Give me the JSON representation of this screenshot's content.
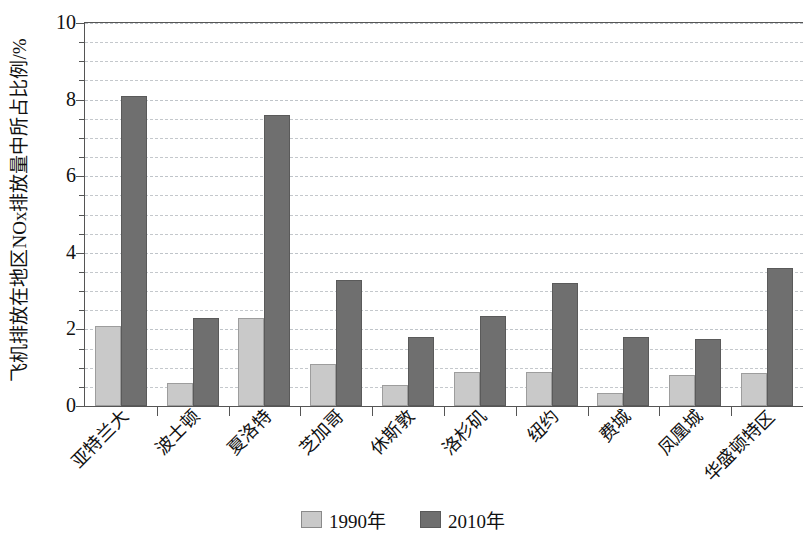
{
  "chart_data": {
    "type": "bar",
    "title": "",
    "xlabel": "",
    "ylabel": "飞机排放在地区NOx排放量中所占比例/%",
    "ylim": [
      0,
      10
    ],
    "ytick_values": [
      0,
      2,
      4,
      6,
      8,
      10
    ],
    "ytick_labels": [
      "0",
      "2",
      "4",
      "6",
      "8",
      "10"
    ],
    "y_minor_step": 0.5,
    "grid": true,
    "grid_axis": "y",
    "legend_position": "bottom-center",
    "categories": [
      "亚特兰大",
      "波士顿",
      "夏洛特",
      "芝加哥",
      "休斯敦",
      "洛杉矶",
      "纽约",
      "费城",
      "凤凰城",
      "华盛顿特区"
    ],
    "series": [
      {
        "name": "1990年",
        "color": "#c9c9c9",
        "values": [
          2.1,
          0.6,
          2.3,
          1.1,
          0.55,
          0.9,
          0.9,
          0.35,
          0.8,
          0.85
        ]
      },
      {
        "name": "2010年",
        "color": "#6f6f6f",
        "values": [
          8.1,
          2.3,
          7.6,
          3.3,
          1.8,
          2.35,
          3.2,
          1.8,
          1.75,
          3.6
        ]
      }
    ]
  },
  "legend": {
    "items": [
      {
        "label": "1990年"
      },
      {
        "label": "2010年"
      }
    ]
  }
}
